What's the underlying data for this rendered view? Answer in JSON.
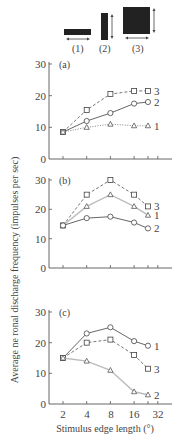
{
  "stimuli": [
    {
      "label": "(1)",
      "shape": "horizontal-bar"
    },
    {
      "label": "(2)",
      "shape": "vertical-bar"
    },
    {
      "label": "(3)",
      "shape": "square"
    }
  ],
  "axes": {
    "ylabel": "Average ne ronal discharge frequency (impulses per sec)",
    "xlabel": "Stimulus edge length (°)",
    "xticks": [
      "2",
      "4",
      "8",
      "16",
      "32"
    ],
    "yticks": [
      "0",
      "10",
      "20",
      "30"
    ]
  },
  "chart_data": [
    {
      "type": "line",
      "panel": "(a)",
      "x": [
        2,
        4,
        8,
        16,
        24
      ],
      "xscale": "log2",
      "ylim": [
        0,
        30
      ],
      "series": [
        {
          "name": "3",
          "marker": "square",
          "line": "dashed",
          "values": [
            8.5,
            15.5,
            20.5,
            21.5,
            21.5
          ]
        },
        {
          "name": "2",
          "marker": "circle",
          "line": "solid",
          "values": [
            8.5,
            12,
            14.5,
            17.5,
            18
          ]
        },
        {
          "name": "1",
          "marker": "triangle",
          "line": "dotted",
          "values": [
            8.5,
            10,
            11,
            10.5,
            10.5
          ]
        }
      ]
    },
    {
      "type": "line",
      "panel": "(b)",
      "x": [
        2,
        4,
        8,
        16,
        24
      ],
      "xscale": "log2",
      "ylim": [
        0,
        30
      ],
      "series": [
        {
          "name": "3",
          "marker": "square",
          "line": "dashed",
          "values": [
            14.5,
            25,
            30,
            25,
            21
          ]
        },
        {
          "name": "1",
          "marker": "triangle",
          "line": "light-solid",
          "values": [
            14.5,
            21,
            25,
            21,
            18
          ]
        },
        {
          "name": "2",
          "marker": "circle",
          "line": "solid",
          "values": [
            14.5,
            17,
            17.5,
            15.5,
            13.5
          ]
        }
      ]
    },
    {
      "type": "line",
      "panel": "(c)",
      "x": [
        2,
        4,
        8,
        16,
        24
      ],
      "xscale": "log2",
      "ylim": [
        0,
        30
      ],
      "series": [
        {
          "name": "1",
          "marker": "circle",
          "line": "solid",
          "values": [
            15,
            23,
            25,
            20.5,
            19
          ]
        },
        {
          "name": "3",
          "marker": "square",
          "line": "dashed",
          "values": [
            15,
            20,
            21,
            16,
            11.5
          ]
        },
        {
          "name": "2",
          "marker": "triangle",
          "line": "light-solid",
          "values": [
            15,
            14,
            11,
            4,
            3
          ]
        }
      ]
    }
  ]
}
